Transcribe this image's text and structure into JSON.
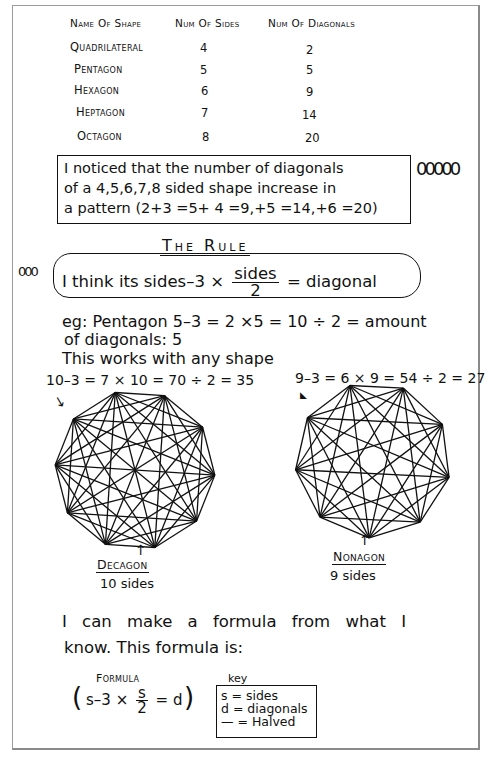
{
  "table": {
    "headers": [
      "Name Of Shape",
      "Num Of Sides",
      "Num Of Diagonals"
    ],
    "rows": [
      {
        "name": "Quadrilateral",
        "sides": "4",
        "diagonals": "2"
      },
      {
        "name": "Pentagon",
        "sides": "5",
        "diagonals": "5"
      },
      {
        "name": "Hexagon",
        "sides": "6",
        "diagonals": "9"
      },
      {
        "name": "Heptagon",
        "sides": "7",
        "diagonals": "14"
      },
      {
        "name": "Octagon",
        "sides": "8",
        "diagonals": "20"
      }
    ]
  },
  "pattern_note": {
    "lines": [
      "I noticed that the number of diagonals",
      "of a 4,5,6,7,8 sided shape increase in",
      "a pattern (2+3 =5+ 4 =9,+5 =14,+6 =20)"
    ],
    "margin_doodle": "00000"
  },
  "rule": {
    "title": "The Rule",
    "margin_doodle": "000",
    "text_before": "I think its sides–3 ×",
    "fraction_num": "sides",
    "fraction_den": "2",
    "text_after": "= diagonal"
  },
  "example": {
    "line1": "eg: Pentagon  5–3 = 2 ×5 = 10 ÷ 2 = amount",
    "line2": "of diagonals: 5",
    "line3": "This works with any shape"
  },
  "decagon": {
    "calc": "10–3 = 7 × 10 = 70 ÷ 2 = 35",
    "name": "Decagon",
    "sides_label": "10 sides",
    "vertices": 10
  },
  "nonagon": {
    "calc": "9–3 = 6 × 9 = 54 ÷ 2 = 27",
    "name": "Nonagon",
    "sides_label": "9 sides",
    "vertices": 9
  },
  "conclusion": {
    "line1": "I can make a formula from what I",
    "line2": "know. This formula is:"
  },
  "formula": {
    "title": "Formula",
    "open": "(",
    "left": "s–3 ×",
    "frac_num": "s",
    "frac_den": "2",
    "right": "= d",
    "close": ")"
  },
  "key": {
    "title": "key",
    "items": [
      "s = sides",
      "d = diagonals",
      "— = Halved"
    ]
  }
}
